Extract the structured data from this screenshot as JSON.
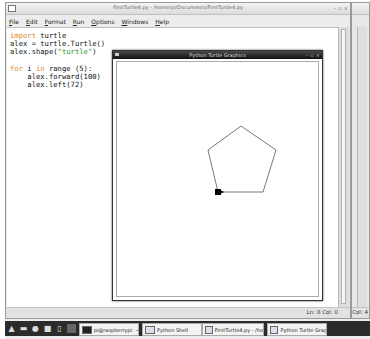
{
  "editor": {
    "title": "FirstTurtle4.py - /home/pi/Documents/FirstTurtle4.py",
    "window_buttons": [
      "–",
      "▫",
      "×"
    ],
    "menu": [
      "File",
      "Edit",
      "Format",
      "Run",
      "Options",
      "Windows",
      "Help"
    ],
    "code_lines": [
      {
        "parts": [
          {
            "t": "import",
            "c": "kw"
          },
          {
            "t": " turtle",
            "c": ""
          }
        ]
      },
      {
        "parts": [
          {
            "t": "alex = turtle.Turtle()",
            "c": ""
          }
        ]
      },
      {
        "parts": [
          {
            "t": "alex.shape(",
            "c": ""
          },
          {
            "t": "\"turtle\"",
            "c": "str"
          },
          {
            "t": ")",
            "c": ""
          }
        ]
      },
      {
        "parts": [
          {
            "t": "",
            "c": ""
          }
        ]
      },
      {
        "parts": [
          {
            "t": "for",
            "c": "kw"
          },
          {
            "t": " i ",
            "c": ""
          },
          {
            "t": "in",
            "c": "kw"
          },
          {
            "t": " range (5):",
            "c": ""
          }
        ]
      },
      {
        "parts": [
          {
            "t": "    alex.forward(100)",
            "c": ""
          }
        ]
      },
      {
        "parts": [
          {
            "t": "    alex.left(72)",
            "c": ""
          }
        ]
      }
    ],
    "status": "Ln: 8 Col: 0"
  },
  "background_window": {
    "status": "Col: 4"
  },
  "turtle_window": {
    "title": "Python Turtle Graphics",
    "window_buttons": [
      "–",
      "▫",
      "×"
    ],
    "pentagon_points": [
      [
        101,
        130
      ],
      [
        146,
        130
      ],
      [
        159,
        88
      ],
      [
        124,
        64
      ],
      [
        91,
        88
      ]
    ],
    "turtle_pos": [
      101,
      130
    ],
    "line_color": "#555555",
    "turtle_color": "#000000"
  },
  "taskbar": {
    "launchers": [
      "menu-icon",
      "terminal-icon",
      "browser-icon",
      "files-icon",
      "text-editor-icon",
      "blank-icon"
    ],
    "tasks": [
      {
        "label": "pi@raspberrypi: ~"
      },
      {
        "label": "Python Shell"
      },
      {
        "label": "FirstTurtle4.py - /home/pi..."
      },
      {
        "label": "Python Turtle Graphics"
      }
    ]
  }
}
